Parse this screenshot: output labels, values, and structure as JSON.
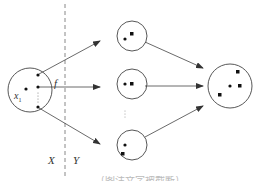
{
  "diagram": {
    "labels": {
      "f": "f",
      "x1": "x",
      "x1_sub": "1",
      "X": "X",
      "Y": "Y"
    },
    "colors": {
      "stroke": "#444444",
      "dashed": "#888888",
      "fill": "#111111",
      "background": "#ffffff"
    },
    "nodes": [
      {
        "id": "domain-set",
        "cx": 30,
        "cy": 90,
        "r": 22,
        "contents": [
          "dot",
          "dot",
          "dot",
          "dot",
          "vertical-ellipsis"
        ]
      },
      {
        "id": "image-set-1",
        "cx": 148,
        "cy": 40,
        "r": 15,
        "contents": [
          "dot",
          "square"
        ]
      },
      {
        "id": "image-set-2",
        "cx": 148,
        "cy": 83,
        "r": 15,
        "contents": [
          "dot",
          "square"
        ]
      },
      {
        "id": "image-set-n",
        "cx": 148,
        "cy": 145,
        "r": 15,
        "contents": [
          "dot",
          "square"
        ]
      },
      {
        "id": "result-set",
        "cx": 230,
        "cy": 86,
        "r": 22,
        "contents": [
          "dot",
          "square",
          "square",
          "square"
        ]
      }
    ],
    "edges": [
      {
        "from": "domain-set",
        "to": "image-set-1"
      },
      {
        "from": "domain-set",
        "to": "image-set-2"
      },
      {
        "from": "domain-set",
        "to": "image-set-n"
      },
      {
        "from": "image-set-1",
        "to": "result-set"
      },
      {
        "from": "image-set-2",
        "to": "result-set"
      },
      {
        "from": "image-set-n",
        "to": "result-set"
      }
    ],
    "middle_ellipsis": "⋮",
    "caption": "（图注文字被截断）"
  }
}
